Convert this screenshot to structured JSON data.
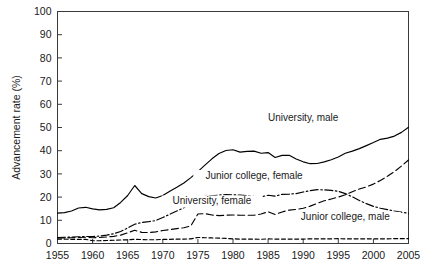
{
  "chart_data": {
    "type": "line",
    "title": "",
    "xlabel": "",
    "ylabel": "Advancement rate (%)",
    "xlim": [
      1955,
      2005
    ],
    "ylim": [
      0,
      100
    ],
    "grid": false,
    "legend_position": "inline-annotations",
    "xticks": [
      "1955",
      "1960",
      "1965",
      "1970",
      "1975",
      "1980",
      "1985",
      "1990",
      "1995",
      "2000",
      "2005"
    ],
    "yticks": [
      "0",
      "10",
      "20",
      "30",
      "40",
      "50",
      "60",
      "70",
      "80",
      "90",
      "100"
    ],
    "x": [
      1955,
      1956,
      1957,
      1958,
      1959,
      1960,
      1961,
      1962,
      1963,
      1964,
      1965,
      1966,
      1967,
      1968,
      1969,
      1970,
      1971,
      1972,
      1973,
      1974,
      1975,
      1976,
      1977,
      1978,
      1979,
      1980,
      1981,
      1982,
      1983,
      1984,
      1985,
      1986,
      1987,
      1988,
      1989,
      1990,
      1991,
      1992,
      1993,
      1994,
      1995,
      1996,
      1997,
      1998,
      1999,
      2000,
      2001,
      2002,
      2003,
      2004,
      2005
    ],
    "series": [
      {
        "name": "University, male",
        "style": "solid",
        "label_x": 1990,
        "label_y": 53,
        "values": [
          13.1,
          13.3,
          14.0,
          15.3,
          15.6,
          14.9,
          14.5,
          14.7,
          15.4,
          17.7,
          20.7,
          25.0,
          21.5,
          20.2,
          19.6,
          20.7,
          22.5,
          24.2,
          26.1,
          28.4,
          31.0,
          33.8,
          36.5,
          38.8,
          40.1,
          40.4,
          39.4,
          39.7,
          39.8,
          38.9,
          39.2,
          37.1,
          38.0,
          38.0,
          36.4,
          35.2,
          34.4,
          34.5,
          35.2,
          36.1,
          37.3,
          38.9,
          39.8,
          40.9,
          42.2,
          43.5,
          44.9,
          45.4,
          46.3,
          47.9,
          50.1
        ]
      },
      {
        "name": "Junior college, female",
        "style": "dash-dot",
        "label_x": 1983,
        "label_y": 28,
        "values": [
          2.6,
          2.7,
          2.8,
          2.9,
          3.0,
          3.0,
          3.2,
          3.6,
          4.2,
          5.2,
          6.7,
          8.3,
          9.1,
          9.4,
          9.9,
          11.2,
          12.6,
          14.0,
          15.4,
          17.5,
          19.9,
          20.3,
          20.6,
          20.9,
          21.1,
          21.0,
          20.9,
          20.6,
          20.3,
          20.1,
          20.8,
          20.4,
          21.2,
          21.3,
          21.5,
          22.2,
          22.8,
          23.2,
          23.1,
          22.9,
          22.5,
          21.5,
          20.1,
          18.5,
          17.2,
          16.0,
          15.2,
          14.6,
          14.0,
          13.5,
          13.0
        ]
      },
      {
        "name": "University, female",
        "style": "dashed",
        "label_x": 1977,
        "label_y": 17,
        "values": [
          2.4,
          2.4,
          2.5,
          2.6,
          2.7,
          2.5,
          2.6,
          2.8,
          3.1,
          3.6,
          4.6,
          5.7,
          4.8,
          4.7,
          5.0,
          5.6,
          6.0,
          6.4,
          6.8,
          7.6,
          12.7,
          12.9,
          12.3,
          12.0,
          12.2,
          12.3,
          12.2,
          12.2,
          12.2,
          12.7,
          13.7,
          12.5,
          13.6,
          14.4,
          14.7,
          15.2,
          16.1,
          17.3,
          18.4,
          19.2,
          20.0,
          21.0,
          22.3,
          23.5,
          24.4,
          25.6,
          27.2,
          29.0,
          31.0,
          33.4,
          36.0
        ]
      },
      {
        "name": "Junior college, male",
        "style": "dashed-fine",
        "label_x": 1996,
        "label_y": 10,
        "values": [
          1.9,
          1.9,
          1.8,
          1.8,
          1.8,
          1.2,
          1.2,
          1.3,
          1.4,
          1.5,
          1.6,
          1.8,
          1.7,
          1.6,
          1.6,
          1.8,
          1.8,
          1.9,
          1.9,
          2.0,
          2.6,
          2.5,
          2.4,
          2.3,
          2.2,
          2.0,
          1.9,
          1.9,
          1.9,
          1.8,
          2.0,
          1.9,
          1.9,
          1.9,
          1.9,
          1.9,
          2.0,
          2.0,
          2.0,
          2.0,
          2.1,
          2.0,
          2.0,
          2.0,
          2.0,
          2.0,
          2.0,
          2.0,
          2.1,
          2.1,
          2.1
        ]
      }
    ]
  }
}
